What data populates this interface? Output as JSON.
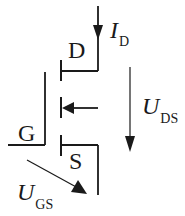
{
  "diagram": {
    "type": "MOSFET symbol (N-channel enhancement) with voltage/current annotations",
    "colors": {
      "line": "#1a1a1a",
      "background": "#ffffff"
    },
    "terminals": {
      "drain": "D",
      "gate": "G",
      "source": "S"
    },
    "annotations": {
      "drain_current": {
        "symbol": "I",
        "subscript": "D"
      },
      "drain_source_voltage": {
        "symbol": "U",
        "subscript": "DS"
      },
      "gate_source_voltage": {
        "symbol": "U",
        "subscript": "GS"
      }
    }
  }
}
